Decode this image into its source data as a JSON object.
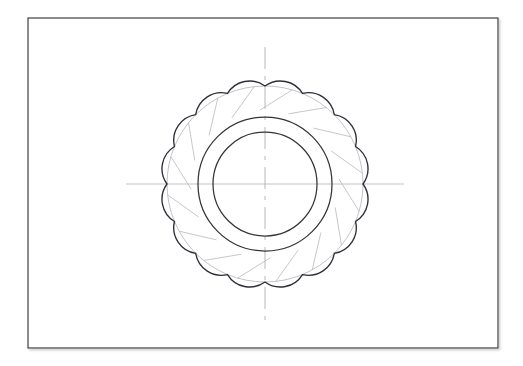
{
  "document": {
    "title": "Engineering Drawing — 16-Tooth Sprocket Plan View",
    "medium": "pencil-on-paper scan",
    "paper_color": "#ffffff",
    "canvas": {
      "width": 523,
      "height": 366
    }
  },
  "frame": {
    "name": "drawing-border",
    "x": 28,
    "y": 18,
    "width": 470,
    "height": 330,
    "stroke_color": "#3a3a3a",
    "stroke_width": 1.2,
    "fill": "#ffffff",
    "shadow_color": "#c9c9c9"
  },
  "geometry": {
    "center": {
      "x": 265,
      "y": 184
    },
    "tooth_count": 16,
    "cusp_radius": 98,
    "tooth_crest_radius": 88,
    "tooth_arc_bulge_radius": 26,
    "start_angle_deg": -90,
    "inner_circles": [
      {
        "name": "hub-outer-circle",
        "radius": 67,
        "stroke_color": "#33333a",
        "stroke_width": 1.25
      },
      {
        "name": "hub-inner-circle",
        "radius": 52,
        "stroke_color": "#33333a",
        "stroke_width": 1.25
      }
    ],
    "construction_circle": {
      "name": "pitch-construction-circle",
      "radius": 98,
      "stroke_color": "#b8b8bd",
      "stroke_width": 0.85
    },
    "construction_chords": {
      "name": "construction-chord-lines",
      "stroke_color": "#b9b9bf",
      "stroke_width": 0.8,
      "inner_radius": 74,
      "outer_radius": 98
    },
    "tooth_profile": {
      "name": "sprocket-tooth-outline",
      "stroke_color": "#2e2e36",
      "stroke_width": 1.35,
      "fill": "none"
    }
  },
  "centerlines": {
    "horizontal": {
      "name": "horizontal-centerline",
      "x1": 126,
      "x2": 404,
      "y": 184,
      "stroke_color": "#bcbcc2",
      "stroke_width": 0.9,
      "dash": "none"
    },
    "vertical": {
      "name": "vertical-centerline",
      "y1": 47,
      "y2": 322,
      "x": 265,
      "stroke_color": "#b0b0b6",
      "stroke_width": 0.9,
      "dash": "22 7 4 7"
    }
  },
  "labels": {
    "view_name": "",
    "scale_note": "",
    "annotations": []
  }
}
